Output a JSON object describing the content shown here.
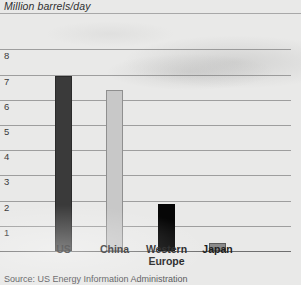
{
  "chart_data": {
    "type": "bar",
    "title": "Million barrels/day",
    "xlabel": "",
    "ylabel": "Million barrels/day",
    "categories": [
      "US",
      "China",
      "Western Europe",
      "Japan"
    ],
    "category_labels": [
      "US",
      "China",
      "Western\nEurope",
      "Japan"
    ],
    "values": [
      6.95,
      6.4,
      1.85,
      0.3
    ],
    "series": [
      {
        "name": "Oil consumption",
        "values": [
          6.95,
          6.4,
          1.85,
          0.3
        ]
      }
    ],
    "bar_colors": [
      "#3a3a3a",
      "#c8c8c8",
      "#060606",
      "#8a8a8a"
    ],
    "bar_border_colors": [
      "#2a2a2a",
      "#8f8f8f",
      "#060606",
      "#5c5c5c"
    ],
    "ylim": [
      0,
      8
    ],
    "yticks": [
      1,
      2,
      3,
      4,
      5,
      6,
      7,
      8
    ],
    "ytick_labels": [
      "1",
      "2",
      "3",
      "4",
      "5",
      "6",
      "7",
      "8"
    ],
    "grid": true,
    "legend": false,
    "legend_position": "none",
    "annotations": []
  },
  "footer": {
    "source": "Source: US Energy Information Administration"
  },
  "colors": {
    "background": "#e9e9e8",
    "gridline": "#9e9e9e",
    "axis": "#6f6f6f",
    "title_text": "#2f2f2f",
    "label_text": "#1d1d1d",
    "source_text": "#59595c"
  }
}
